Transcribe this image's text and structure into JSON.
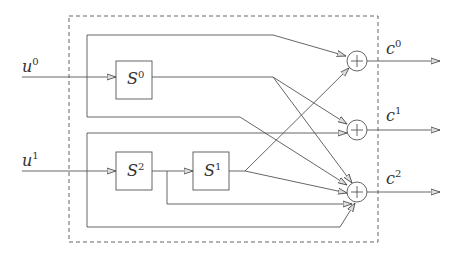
{
  "diagram": {
    "title": "",
    "inputs": [
      {
        "id": "u0",
        "base": "u",
        "sup": "0"
      },
      {
        "id": "u1",
        "base": "u",
        "sup": "1"
      }
    ],
    "blocks": [
      {
        "id": "S0",
        "base": "S",
        "sup": "0"
      },
      {
        "id": "S2",
        "base": "S",
        "sup": "2"
      },
      {
        "id": "S1",
        "base": "S",
        "sup": "1"
      }
    ],
    "adders": [
      {
        "id": "add0",
        "symbol": "+"
      },
      {
        "id": "add1",
        "symbol": "+"
      },
      {
        "id": "add2",
        "symbol": "+"
      }
    ],
    "outputs": [
      {
        "id": "c0",
        "base": "c",
        "sup": "0"
      },
      {
        "id": "c1",
        "base": "c",
        "sup": "1"
      },
      {
        "id": "c2",
        "base": "c",
        "sup": "2"
      }
    ],
    "edges": [
      {
        "from": "u0",
        "to": "S0"
      },
      {
        "from": "u0",
        "to": "add0"
      },
      {
        "from": "u0",
        "to": "add2"
      },
      {
        "from": "S0",
        "to": "add1"
      },
      {
        "from": "S0",
        "to": "add2"
      },
      {
        "from": "u1",
        "to": "S2"
      },
      {
        "from": "u1",
        "to": "add1"
      },
      {
        "from": "u1",
        "to": "add2"
      },
      {
        "from": "S2",
        "to": "S1"
      },
      {
        "from": "S2",
        "to": "add2"
      },
      {
        "from": "S1",
        "to": "add0"
      },
      {
        "from": "S1",
        "to": "add2"
      },
      {
        "from": "add0",
        "to": "c0"
      },
      {
        "from": "add1",
        "to": "c1"
      },
      {
        "from": "add2",
        "to": "c2"
      }
    ],
    "enclosure": "dashed-box"
  }
}
